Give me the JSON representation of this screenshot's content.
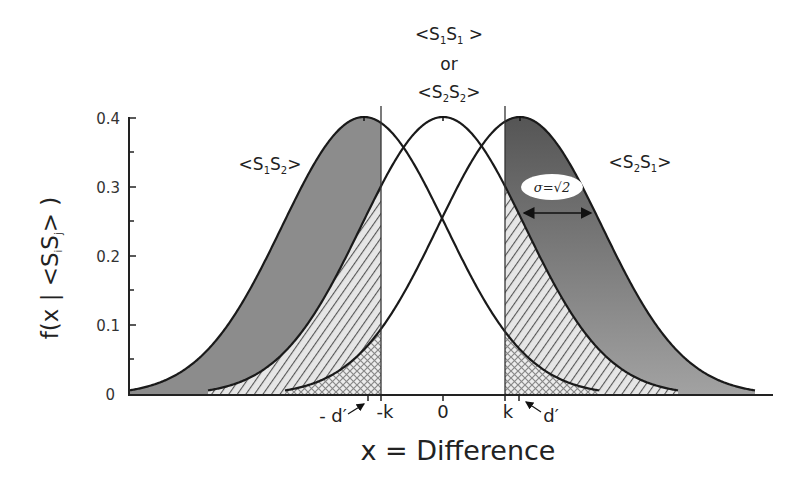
{
  "chart_data": {
    "type": "line",
    "title": "",
    "xlabel": "x = Difference",
    "ylabel": "f(x | <SiSj> )",
    "ylim": [
      0,
      0.4
    ],
    "y_ticks": [
      "0",
      "0.1",
      "0.2",
      "0.3",
      "0.4"
    ],
    "x_ticks": [
      "-d'",
      "-k",
      "0",
      "k",
      "d'"
    ],
    "grid": false,
    "series": [
      {
        "name": "<S1S2>",
        "distribution": "normal",
        "mean": "-d'",
        "sigma": "sqrt(2)",
        "peak": 0.4,
        "fill": "gray (left of -k)"
      },
      {
        "name": "<S1S1> or <S2S2>",
        "distribution": "normal",
        "mean": 0,
        "sigma": "sqrt(2)",
        "peak": 0.4,
        "fill": "diagonal hatch (tails beyond ±k)"
      },
      {
        "name": "<S2S1>",
        "distribution": "normal",
        "mean": "d'",
        "sigma": "sqrt(2)",
        "peak": 0.4,
        "fill": "dark gray (right of k)"
      }
    ],
    "thresholds": [
      "-k",
      "k"
    ],
    "annotations": [
      "σ=√2"
    ]
  },
  "labels": {
    "center_top": "<S",
    "center_or": "or",
    "left_curve": "<S1S2>",
    "right_curve": "<S2S1>",
    "sigma": "σ=√2",
    "x_axis": "x = Difference",
    "y_axis_prefix": "f(x | <S",
    "y_axis_suffix": "> )",
    "tick_neg_dprime": "- d′",
    "tick_neg_k": "-k",
    "tick_zero": "0",
    "tick_k": "k",
    "tick_dprime": "d′",
    "y0": "0",
    "y1": "0.1",
    "y2": "0.2",
    "y3": "0.3",
    "y4": "0.4"
  },
  "colors": {
    "left_fill": "#8c8c8c",
    "right_fill_top": "#555555",
    "right_fill_bottom": "#a0a0a0",
    "line": "#1a1a1a"
  }
}
